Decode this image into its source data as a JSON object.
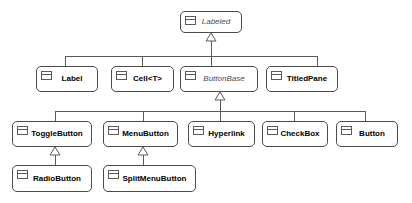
{
  "diagram": {
    "type": "uml-class-diagram",
    "relationship": "generalization",
    "icon_name": "uml-class-icon",
    "colors": {
      "background": "#ffffff",
      "node_fill": "#ffffff",
      "node_border": "#4a4a4a",
      "edge": "#5a5a5a",
      "text": "#000000",
      "abstract_text": "#4b4b4b"
    },
    "nodes": [
      {
        "id": "labeled",
        "label": "Labeled",
        "abstract": true,
        "x": 180,
        "y": 11,
        "w": 62,
        "h": 22
      },
      {
        "id": "label",
        "label": "Label",
        "abstract": false,
        "x": 36,
        "y": 66,
        "w": 62,
        "h": 26
      },
      {
        "id": "cell",
        "label": "Cell<T>",
        "abstract": false,
        "x": 111,
        "y": 66,
        "w": 63,
        "h": 26
      },
      {
        "id": "buttonbase",
        "label": "ButtonBase",
        "abstract": true,
        "x": 180,
        "y": 66,
        "w": 78,
        "h": 26
      },
      {
        "id": "titledpane",
        "label": "TitledPane",
        "abstract": false,
        "x": 266,
        "y": 66,
        "w": 72,
        "h": 26
      },
      {
        "id": "togglebutton",
        "label": "ToggleButton",
        "abstract": false,
        "x": 12,
        "y": 121,
        "w": 80,
        "h": 26
      },
      {
        "id": "menubutton",
        "label": "MenuButton",
        "abstract": false,
        "x": 103,
        "y": 121,
        "w": 75,
        "h": 26
      },
      {
        "id": "hyperlink",
        "label": "Hyperlink",
        "abstract": false,
        "x": 188,
        "y": 121,
        "w": 67,
        "h": 26
      },
      {
        "id": "checkbox",
        "label": "CheckBox",
        "abstract": false,
        "x": 262,
        "y": 121,
        "w": 66,
        "h": 26
      },
      {
        "id": "button",
        "label": "Button",
        "abstract": false,
        "x": 336,
        "y": 121,
        "w": 62,
        "h": 26
      },
      {
        "id": "radiobutton",
        "label": "RadioButton",
        "abstract": false,
        "x": 12,
        "y": 165,
        "w": 80,
        "h": 27
      },
      {
        "id": "splitmenubutton",
        "label": "SplitMenuButton",
        "abstract": false,
        "x": 103,
        "y": 165,
        "w": 93,
        "h": 27
      }
    ],
    "edges": [
      {
        "from": "label",
        "to": "labeled",
        "name": "edge-label-to-labeled"
      },
      {
        "from": "cell",
        "to": "labeled",
        "name": "edge-cell-to-labeled"
      },
      {
        "from": "buttonbase",
        "to": "labeled",
        "name": "edge-buttonbase-to-labeled"
      },
      {
        "from": "titledpane",
        "to": "labeled",
        "name": "edge-titledpane-to-labeled"
      },
      {
        "from": "togglebutton",
        "to": "buttonbase",
        "name": "edge-togglebutton-to-buttonbase"
      },
      {
        "from": "menubutton",
        "to": "buttonbase",
        "name": "edge-menubutton-to-buttonbase"
      },
      {
        "from": "hyperlink",
        "to": "buttonbase",
        "name": "edge-hyperlink-to-buttonbase"
      },
      {
        "from": "checkbox",
        "to": "buttonbase",
        "name": "edge-checkbox-to-buttonbase"
      },
      {
        "from": "button",
        "to": "buttonbase",
        "name": "edge-button-to-buttonbase"
      },
      {
        "from": "radiobutton",
        "to": "togglebutton",
        "name": "edge-radiobutton-to-togglebutton"
      },
      {
        "from": "splitmenubutton",
        "to": "menubutton",
        "name": "edge-splitmenubutton-to-menubutton"
      }
    ]
  }
}
